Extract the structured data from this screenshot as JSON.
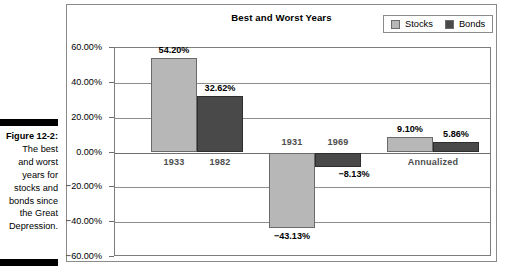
{
  "caption": {
    "figure_number": "Figure 12-2:",
    "lines": [
      "The best",
      "and worst",
      "years for",
      "stocks and",
      "bonds since",
      "the Great",
      "Depression."
    ]
  },
  "chart_data": {
    "type": "bar",
    "title": "Best and Worst Years",
    "xlabel": "",
    "ylabel": "",
    "ylim": [
      -60,
      60
    ],
    "ytick_values": [
      60,
      40,
      20,
      0,
      -20,
      -40,
      -60
    ],
    "ytick_labels": [
      "60.00%",
      "40.00%",
      "20.00%",
      "0.00%",
      "−20.00%",
      "−40.00%",
      "−60.00%"
    ],
    "grid": true,
    "legend_position": "top-right",
    "legend": [
      "Stocks",
      "Bonds"
    ],
    "series": [
      {
        "name": "Stocks",
        "color": "#b7b7b7"
      },
      {
        "name": "Bonds",
        "color": "#494949"
      }
    ],
    "groups": [
      {
        "name": "best-year",
        "bars": [
          {
            "series": "Stocks",
            "category": "1933",
            "value": 54.2,
            "value_label": "54.20%"
          },
          {
            "series": "Bonds",
            "category": "1982",
            "value": 32.62,
            "value_label": "32.62%"
          }
        ]
      },
      {
        "name": "worst-year",
        "bars": [
          {
            "series": "Stocks",
            "category": "1931",
            "value": -43.13,
            "value_label": "−43.13%"
          },
          {
            "series": "Bonds",
            "category": "1969",
            "value": -8.13,
            "value_label": "−8.13%"
          }
        ]
      },
      {
        "name": "annualized",
        "label": "Annualized",
        "bars": [
          {
            "series": "Stocks",
            "category": "Annualized",
            "value": 9.1,
            "value_label": "9.10%"
          },
          {
            "series": "Bonds",
            "category": "Annualized",
            "value": 5.86,
            "value_label": "5.86%"
          }
        ]
      }
    ],
    "category_labels": [
      "1933",
      "1982",
      "1931",
      "1969",
      "Annualized"
    ],
    "value_labels": [
      "54.20%",
      "32.62%",
      "−43.13%",
      "−8.13%",
      "9.10%",
      "5.86%"
    ]
  }
}
